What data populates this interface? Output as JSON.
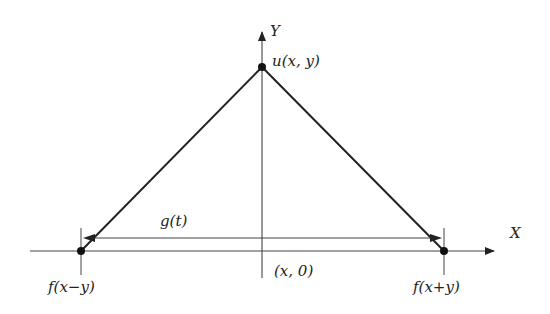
{
  "diagram": {
    "axes": {
      "x_label": "X",
      "y_label": "Y"
    },
    "points": {
      "apex": "u(x, y)",
      "left": "f(x−y)",
      "right": "f(x+y)",
      "origin_foot": "(x, 0)"
    },
    "segment_label": "g(t)",
    "colors": {
      "line": "#222222",
      "axis": "#444444"
    }
  }
}
